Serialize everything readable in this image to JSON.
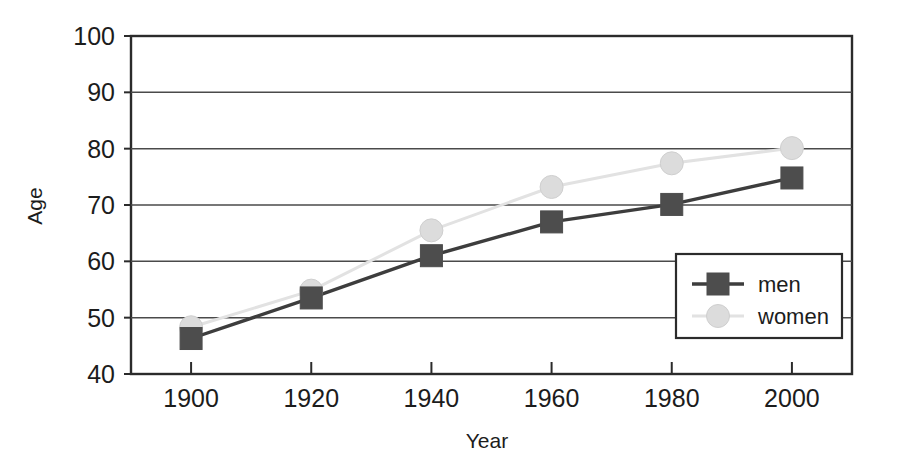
{
  "chart_data": {
    "type": "line",
    "title": "",
    "subtitle": "",
    "xlabel": "Year",
    "ylabel": "Age",
    "categories": [
      "1900",
      "1920",
      "1940",
      "1960",
      "1980",
      "2000"
    ],
    "x": [
      1900,
      1920,
      1940,
      1960,
      1980,
      2000
    ],
    "xlim": [
      1890,
      2010
    ],
    "ylim": [
      40,
      100
    ],
    "y_ticks": [
      "40",
      "50",
      "60",
      "70",
      "80",
      "90",
      "100"
    ],
    "y_tick_values": [
      40,
      50,
      60,
      70,
      80,
      90,
      100
    ],
    "grid": "horizontal",
    "legend_position": "bottom-right",
    "series": [
      {
        "name": "men",
        "marker": "square",
        "color": "#4d4d4d",
        "line_color": "#3d3d3d",
        "values": [
          46.3,
          53.5,
          61.0,
          67.0,
          70.1,
          74.8
        ]
      },
      {
        "name": "women",
        "marker": "circle",
        "color": "#dcdcdc",
        "line_color": "#e2e2e2",
        "values": [
          48.3,
          54.8,
          65.5,
          73.2,
          77.4,
          80.1
        ]
      }
    ],
    "annotations": []
  },
  "axes": {
    "y_title": "Age",
    "x_title": "Year"
  },
  "legend": {
    "entries": [
      {
        "label": "men"
      },
      {
        "label": "women"
      }
    ]
  },
  "colors": {
    "men_marker": "#4d4d4d",
    "men_line": "#3d3d3d",
    "women_marker": "#dcdcdc",
    "women_line": "#e2e2e2",
    "axis": "#2b2b2b",
    "grid": "#4a4a4a",
    "background": "#ffffff",
    "text": "#1c1c1c"
  }
}
